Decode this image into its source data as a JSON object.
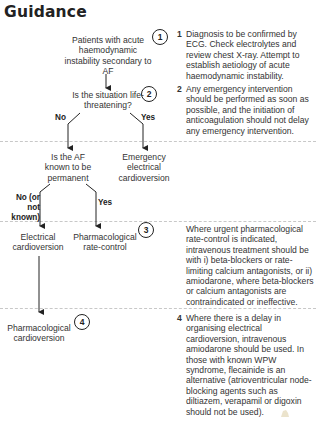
{
  "title": "Guidance",
  "nodes": {
    "start": "Patients with acute haemodynamic instability secondary to AF",
    "life_threatening": "Is the situation life-threatening?",
    "permanent": "Is the AF known to be permanent",
    "emergency": "Emergency electrical cardioversion",
    "electrical": "Electrical cardioversion",
    "rate_control": "Pharmacological rate-control",
    "pharm_cardioversion": "Pharmacological cardioversion"
  },
  "edge_labels": {
    "no_1": "No",
    "yes_1": "Yes",
    "no_2": "No (or not known)",
    "yes_2": "Yes"
  },
  "markers": [
    "1",
    "2",
    "3",
    "4"
  ],
  "notes": [
    {
      "num": "1",
      "text": "Diagnosis to be confirmed by ECG. Check electrolytes and review chest X-ray. Attempt to establish aetiology of acute haemodynamic instability."
    },
    {
      "num": "2",
      "text": "Any emergency intervention should be performed as soon as possible, and the initiation of anticoagulation should not delay any emergency intervention."
    },
    {
      "num": "",
      "text": "Where urgent pharmacological rate-control is indicated, intravenous treatment should be with i) beta-blockers or rate-limiting calcium antagonists, or ii) amiodarone, where beta-blockers or calcium antagonists are contraindicated or ineffective."
    },
    {
      "num": "4",
      "text": "Where there is a delay in organising electrical cardioversion, intravenous amiodarone should be used. In those with known WPW syndrome, flecainide is an alternative (atrioventricular node-blocking agents such as diltiazem, verapamil or digoxin should not be used)."
    }
  ]
}
